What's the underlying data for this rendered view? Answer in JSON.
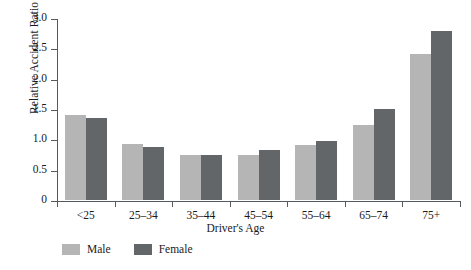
{
  "chart_data": {
    "type": "bar",
    "title": "",
    "xlabel": "Driver's Age",
    "ylabel": "Relative Accident Ratio",
    "categories": [
      "<25",
      "25–34",
      "35–44",
      "45–54",
      "55–64",
      "65–74",
      "75+"
    ],
    "series": [
      {
        "name": "Male",
        "color": "#b5b5b5",
        "values": [
          1.4,
          0.93,
          0.75,
          0.75,
          0.91,
          1.23,
          2.4
        ]
      },
      {
        "name": "Female",
        "color": "#636669",
        "values": [
          1.36,
          0.88,
          0.75,
          0.82,
          0.97,
          1.5,
          2.78
        ]
      }
    ],
    "ylim": [
      0,
      3.0
    ],
    "yticks": [
      "0",
      "0.5",
      "1.0",
      "1.5",
      "2.0",
      "2.5",
      "3.0"
    ],
    "ytick_values": [
      0,
      0.5,
      1.0,
      1.5,
      2.0,
      2.5,
      3.0
    ],
    "grid": false,
    "legend_position": "bottom-left"
  },
  "colors": {
    "axis": "#555a5e",
    "text": "#1a1a1a",
    "background": "#ffffff",
    "male": "#b5b5b5",
    "female": "#636669"
  }
}
